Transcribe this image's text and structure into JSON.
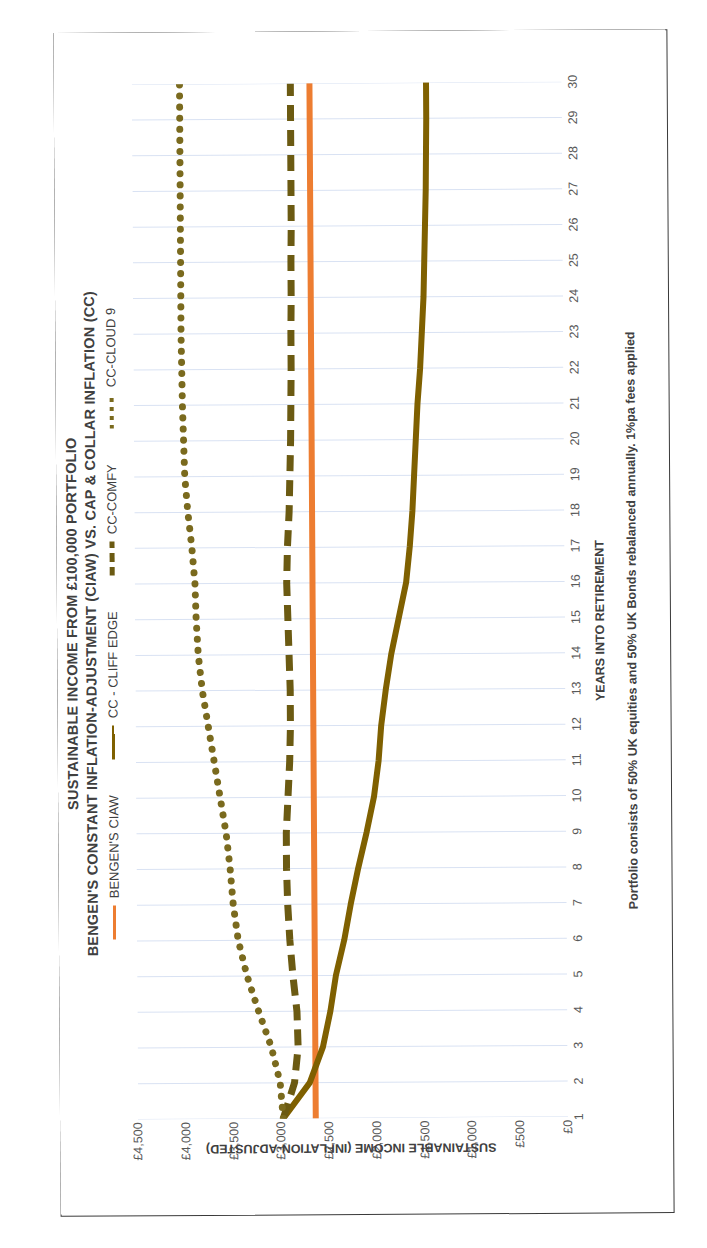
{
  "title": {
    "line1": "SUSTAINABLE INCOME FROM £100,000 PORTFOLIO",
    "line2": "BENGEN'S CONSTANT INFLATION-ADJUSTMENT (CIAW) VS. CAP & COLLAR INFLATION (CC)"
  },
  "footnote": "Portfolio consists of 50% UK equities and 50% UK Bonds rebalanced annually.  1%pa fees applied",
  "colors": {
    "bengen_orange": "#ED7D31",
    "cliff_edge_olive": "#7F6000",
    "comfy_olive": "#6B5A12",
    "cloud9_olive": "#7A6A1E",
    "gridline": "#D9E2F3",
    "axis_text": "#595959",
    "title_text": "#404040",
    "frame_border": "#3A3A3A"
  },
  "chart_data": {
    "type": "line",
    "xlabel": "YEARS INTO RETIREMENT",
    "ylabel": "SUSTAINABLE INCOME (INFLATION-ADJUSTED)",
    "grid": true,
    "legend_position": "top",
    "xlim": [
      1,
      30
    ],
    "ylim": [
      0,
      4500
    ],
    "ytick_labels": [
      "£4,500",
      "£4,000",
      "£3,500",
      "£3,000",
      "£2,500",
      "£2,000",
      "£1,500",
      "£1,000",
      "£500",
      "£0"
    ],
    "ytick_values": [
      4500,
      4000,
      3500,
      3000,
      2500,
      2000,
      1500,
      1000,
      500,
      0
    ],
    "x": [
      1,
      2,
      3,
      4,
      5,
      6,
      7,
      8,
      9,
      10,
      11,
      12,
      13,
      14,
      15,
      16,
      17,
      18,
      19,
      20,
      21,
      22,
      23,
      24,
      25,
      26,
      27,
      28,
      29,
      30
    ],
    "xtick_labels": [
      "1",
      "2",
      "3",
      "4",
      "5",
      "6",
      "7",
      "8",
      "9",
      "10",
      "11",
      "12",
      "13",
      "14",
      "15",
      "16",
      "17",
      "18",
      "19",
      "20",
      "21",
      "22",
      "23",
      "24",
      "25",
      "26",
      "27",
      "28",
      "29",
      "30"
    ],
    "series": [
      {
        "name": "BENGEN'S CIAW",
        "style": "solid",
        "color": "#ED7D31",
        "values": [
          2640,
          2640,
          2640,
          2640,
          2640,
          2640,
          2640,
          2640,
          2640,
          2640,
          2640,
          2640,
          2640,
          2640,
          2640,
          2640,
          2640,
          2640,
          2640,
          2640,
          2640,
          2640,
          2640,
          2640,
          2640,
          2640,
          2640,
          2640,
          2640,
          2640
        ]
      },
      {
        "name": "CC - CLIFF EDGE",
        "style": "solid",
        "color": "#7F6000",
        "values": [
          2980,
          2700,
          2560,
          2480,
          2420,
          2330,
          2260,
          2180,
          2090,
          2010,
          1960,
          1930,
          1880,
          1820,
          1740,
          1660,
          1620,
          1590,
          1570,
          1550,
          1530,
          1500,
          1480,
          1460,
          1450,
          1440,
          1430,
          1425,
          1420,
          1420
        ]
      },
      {
        "name": "CC-COMFY",
        "style": "dashed",
        "color": "#6B5A12",
        "values": [
          2980,
          2860,
          2820,
          2830,
          2870,
          2900,
          2920,
          2930,
          2930,
          2910,
          2890,
          2880,
          2880,
          2890,
          2900,
          2910,
          2900,
          2880,
          2870,
          2860,
          2855,
          2850,
          2850,
          2845,
          2845,
          2840,
          2840,
          2840,
          2840,
          2840
        ]
      },
      {
        "name": "CC-CLOUD 9",
        "style": "dotted",
        "color": "#7A6A1E",
        "values": [
          2980,
          3010,
          3100,
          3230,
          3350,
          3440,
          3490,
          3520,
          3560,
          3620,
          3680,
          3740,
          3800,
          3840,
          3860,
          3870,
          3900,
          3940,
          3970,
          3980,
          3990,
          3995,
          4000,
          4000,
          4000,
          4000,
          4000,
          4000,
          4000,
          4000
        ]
      }
    ]
  },
  "legend": [
    {
      "label": "BENGEN'S CIAW",
      "style": "solid-orange"
    },
    {
      "label": "CC - CLIFF EDGE",
      "style": "solid-olive"
    },
    {
      "label": "CC-COMFY",
      "style": "dashed-olive"
    },
    {
      "label": "CC-CLOUD 9",
      "style": "dotted-olive"
    }
  ]
}
